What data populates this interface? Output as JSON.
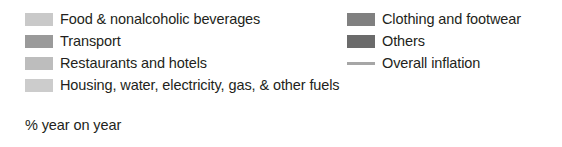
{
  "chart_data": {
    "type": "bar",
    "title": "",
    "xlabel": "",
    "ylabel": "% year on year",
    "legend_position": "top",
    "grid": false,
    "note": "Legend-only crop of a stacked bar chart of contributions to inflation; no plotted data points are visible in this image.",
    "categories": [],
    "series": [
      {
        "name": "Food & nonalcoholic beverages",
        "color": "#c9c9c9",
        "marker": "swatch",
        "values": []
      },
      {
        "name": "Transport",
        "color": "#9a9a9a",
        "marker": "swatch",
        "values": []
      },
      {
        "name": "Restaurants and hotels",
        "color": "#bdbdbd",
        "marker": "swatch",
        "values": []
      },
      {
        "name": "Housing, water, electricity, gas, & other fuels",
        "color": "#cccccc",
        "marker": "swatch",
        "values": []
      },
      {
        "name": "Clothing and footwear",
        "color": "#808080",
        "marker": "swatch",
        "values": []
      },
      {
        "name": "Others",
        "color": "#6b6b6b",
        "marker": "swatch",
        "values": []
      },
      {
        "name": "Overall inflation",
        "color": "#a6a6a6",
        "marker": "line",
        "values": []
      }
    ]
  },
  "legend": {
    "left_column": [
      {
        "label": "Food & nonalcoholic beverages",
        "color": "#c9c9c9",
        "marker": "swatch"
      },
      {
        "label": "Transport",
        "color": "#9a9a9a",
        "marker": "swatch"
      },
      {
        "label": "Restaurants and hotels",
        "color": "#bdbdbd",
        "marker": "swatch"
      },
      {
        "label": "Housing, water, electricity, gas, & other fuels",
        "color": "#cccccc",
        "marker": "swatch"
      }
    ],
    "right_column": [
      {
        "label": "Clothing and footwear",
        "color": "#808080",
        "marker": "swatch"
      },
      {
        "label": "Others",
        "color": "#6b6b6b",
        "marker": "swatch"
      },
      {
        "label": "Overall inflation",
        "color": "#a6a6a6",
        "marker": "line"
      }
    ]
  },
  "axis_note": {
    "text": "% year on year"
  }
}
